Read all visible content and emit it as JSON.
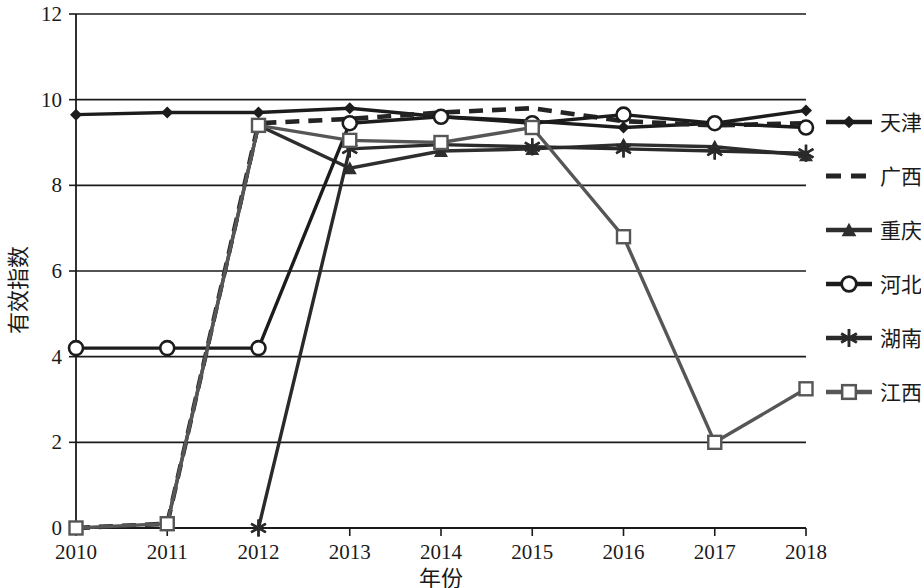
{
  "chart_data": {
    "type": "line",
    "title": "",
    "xlabel": "年份",
    "ylabel": "有效指数",
    "categories": [
      "2010",
      "2011",
      "2012",
      "2013",
      "2014",
      "2015",
      "2016",
      "2017",
      "2018"
    ],
    "x": [
      2010,
      2011,
      2012,
      2013,
      2014,
      2015,
      2016,
      2017,
      2018
    ],
    "xlim": [
      2010,
      2018
    ],
    "ylim": [
      0,
      12
    ],
    "yticks": [
      0,
      2,
      4,
      6,
      8,
      10,
      12
    ],
    "grid": true,
    "legend_position": "right",
    "series": [
      {
        "name": "天津",
        "marker": "diamond",
        "dash": "solid",
        "color": "#1c1c1c",
        "values": [
          9.65,
          9.7,
          9.7,
          9.8,
          9.6,
          9.5,
          9.35,
          9.45,
          9.75
        ]
      },
      {
        "name": "广西",
        "marker": "none",
        "dash": "dashed",
        "color": "#242424",
        "values": [
          0.0,
          0.1,
          9.45,
          9.55,
          9.7,
          9.8,
          9.5,
          9.4,
          9.45
        ]
      },
      {
        "name": "重庆",
        "marker": "triangle",
        "dash": "solid",
        "color": "#2e2e2e",
        "values": [
          null,
          0.1,
          9.4,
          8.4,
          8.8,
          8.85,
          8.95,
          8.9,
          8.7
        ]
      },
      {
        "name": "河北",
        "marker": "circle-open",
        "dash": "solid",
        "color": "#1c1c1c",
        "values": [
          4.2,
          4.2,
          4.2,
          9.45,
          9.6,
          9.45,
          9.65,
          9.45,
          9.35
        ]
      },
      {
        "name": "湖南",
        "marker": "asterisk",
        "dash": "solid",
        "color": "#2a2a2a",
        "values": [
          null,
          null,
          0.0,
          8.85,
          8.95,
          8.9,
          8.85,
          8.8,
          8.75
        ]
      },
      {
        "name": "江西",
        "marker": "square-open",
        "dash": "solid",
        "color": "#565656",
        "values": [
          0.0,
          0.1,
          9.4,
          9.05,
          9.0,
          9.35,
          6.8,
          2.0,
          3.25
        ]
      }
    ]
  },
  "legend": {
    "items": [
      {
        "label": "天津",
        "marker": "diamond",
        "dash": "solid"
      },
      {
        "label": "广西",
        "marker": "none",
        "dash": "dashed"
      },
      {
        "label": "重庆",
        "marker": "triangle",
        "dash": "solid"
      },
      {
        "label": "河北",
        "marker": "circle-open",
        "dash": "solid"
      },
      {
        "label": "湖南",
        "marker": "asterisk",
        "dash": "solid"
      },
      {
        "label": "江西",
        "marker": "square-open",
        "dash": "solid"
      }
    ]
  },
  "axes": {
    "y_tick_labels": [
      "12",
      "10",
      "8",
      "6",
      "4",
      "2",
      "0"
    ],
    "x_tick_labels": [
      "2010",
      "2011",
      "2012",
      "2013",
      "2014",
      "2015",
      "2016",
      "2017",
      "2018"
    ],
    "y_title": "有效指数",
    "x_title": "年份"
  }
}
